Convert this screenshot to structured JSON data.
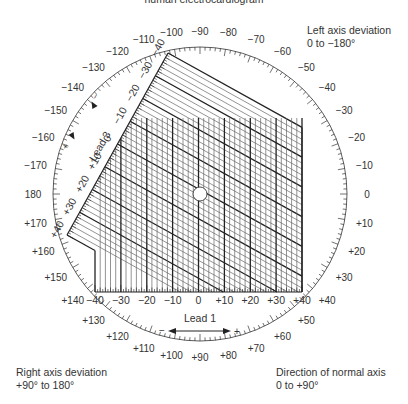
{
  "title": "human electrocardiogram",
  "captions": {
    "left_axis": [
      "Left axis deviation",
      "0 to −180°"
    ],
    "right_axis": [
      "Right axis deviation",
      "+90° to 180°"
    ],
    "normal_axis": [
      "Direction of normal axis",
      "0 to +90°"
    ]
  },
  "dial": {
    "labels": [
      {
        "deg": -170,
        "text": "−170"
      },
      {
        "deg": -160,
        "text": "−160"
      },
      {
        "deg": -150,
        "text": "−150"
      },
      {
        "deg": -140,
        "text": "−140"
      },
      {
        "deg": -130,
        "text": "−130"
      },
      {
        "deg": -120,
        "text": "−120"
      },
      {
        "deg": -110,
        "text": "−110"
      },
      {
        "deg": -100,
        "text": "−100"
      },
      {
        "deg": -90,
        "text": "−90"
      },
      {
        "deg": -80,
        "text": "−80"
      },
      {
        "deg": -70,
        "text": "−70"
      },
      {
        "deg": -60,
        "text": "−60"
      },
      {
        "deg": -50,
        "text": "−50"
      },
      {
        "deg": -40,
        "text": "−40"
      },
      {
        "deg": -30,
        "text": "−30"
      },
      {
        "deg": -20,
        "text": "−20"
      },
      {
        "deg": -10,
        "text": "−10"
      },
      {
        "deg": 0,
        "text": "0"
      },
      {
        "deg": 10,
        "text": "+10"
      },
      {
        "deg": 20,
        "text": "+20"
      },
      {
        "deg": 30,
        "text": "+30"
      },
      {
        "deg": 40,
        "text": "+40"
      },
      {
        "deg": 50,
        "text": "+50"
      },
      {
        "deg": 60,
        "text": "+60"
      },
      {
        "deg": 70,
        "text": "+70"
      },
      {
        "deg": 80,
        "text": "+80"
      },
      {
        "deg": 90,
        "text": "+90"
      },
      {
        "deg": 100,
        "text": "+100"
      },
      {
        "deg": 110,
        "text": "+110"
      },
      {
        "deg": 120,
        "text": "+120"
      },
      {
        "deg": 130,
        "text": "+130"
      },
      {
        "deg": 140,
        "text": "+140"
      },
      {
        "deg": 150,
        "text": "+150"
      },
      {
        "deg": 160,
        "text": "+160"
      },
      {
        "deg": 170,
        "text": "+170"
      },
      {
        "deg": 180,
        "text": "180"
      }
    ]
  },
  "lead1": {
    "name": "Lead 1",
    "minus": "−",
    "plus": "+",
    "ticks": [
      "−40",
      "−30",
      "−20",
      "−10",
      "0",
      "+10",
      "+20",
      "+30",
      "+40"
    ]
  },
  "lead3": {
    "name": "Lead 3",
    "minus": "−",
    "plus": "+",
    "ticks": [
      "−40",
      "−30",
      "−20",
      "−10",
      "0",
      "+10",
      "+20",
      "+30",
      "+40"
    ]
  },
  "colors": {
    "line": "#222222",
    "thin": "#555555",
    "text": "#333333"
  }
}
